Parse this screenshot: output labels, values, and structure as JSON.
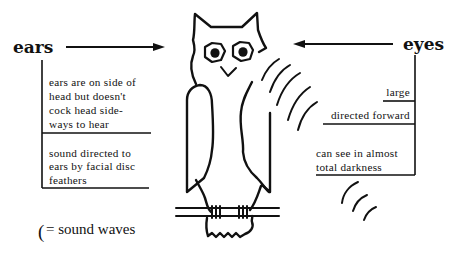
{
  "diagram": {
    "ears": {
      "label": "ears",
      "facts": [
        {
          "lines": [
            "ears are on side of",
            "head but doesn't",
            "cock head side-",
            "ways to hear"
          ]
        },
        {
          "lines": [
            "sound directed to",
            "ears by facial disc",
            "feathers"
          ]
        }
      ]
    },
    "eyes": {
      "label": "eyes",
      "facts": [
        {
          "lines": [
            "large"
          ]
        },
        {
          "lines": [
            "directed forward"
          ]
        },
        {
          "lines": [
            "can see in almost",
            "total darkness"
          ]
        }
      ]
    },
    "legend": {
      "symbol": "(",
      "text": "= sound waves"
    },
    "colors": {
      "ink": "#111111",
      "background": "#ffffff"
    }
  }
}
